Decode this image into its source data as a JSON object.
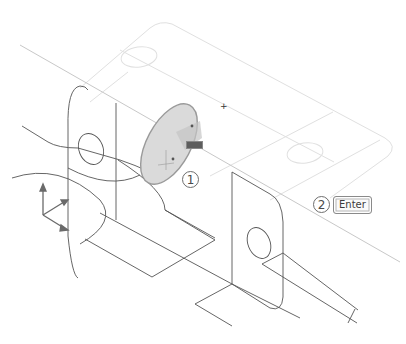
{
  "scene": {
    "type": "cad-3d-isometric-viewport",
    "background": "#ffffff",
    "wire_color": "#555555",
    "ghost_color": "#e2e2e2",
    "selection_fill": "#d8d8d8",
    "selection_edge": "#9a9a9a"
  },
  "callouts": [
    {
      "number": "1",
      "target": "selected-circular-face"
    },
    {
      "number": "2",
      "key_label": "Enter"
    }
  ],
  "cursor": {
    "glyph": "+"
  },
  "ucs_icon": {
    "axes": [
      "z",
      "y",
      "x"
    ]
  },
  "grip_tooltip": {
    "color": "#5d5d5d"
  }
}
